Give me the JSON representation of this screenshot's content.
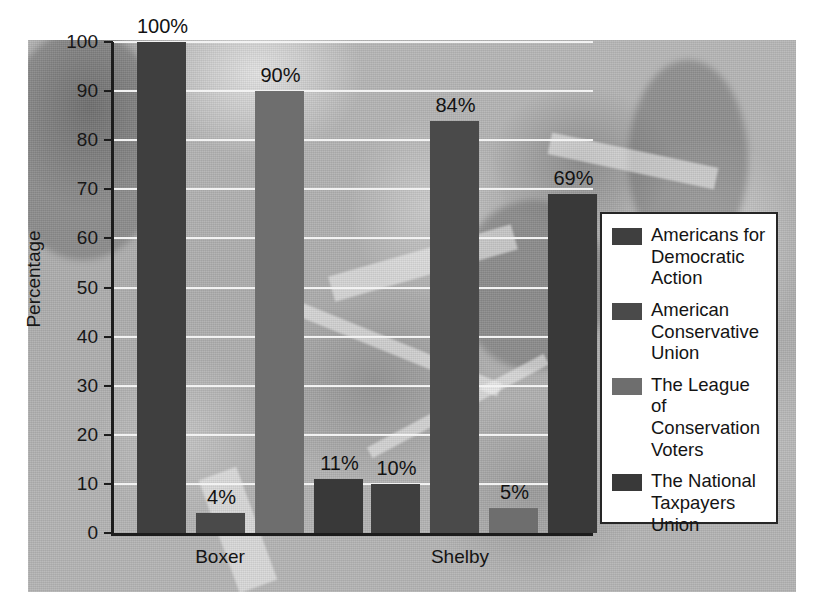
{
  "chart_data": {
    "type": "bar",
    "title": "",
    "xlabel": "",
    "ylabel": "Percentage",
    "ylim": [
      0,
      100
    ],
    "ytick_labels": [
      "100",
      "90",
      "80",
      "70",
      "60",
      "50",
      "40",
      "30",
      "20",
      "10",
      "0"
    ],
    "ytick_values": [
      100,
      90,
      80,
      70,
      60,
      50,
      40,
      30,
      20,
      10,
      0
    ],
    "grid": true,
    "legend_position": "right",
    "categories": [
      "Boxer",
      "Shelby"
    ],
    "series": [
      {
        "name": "Americans for Democratic Action",
        "color": "#3f3f3f",
        "values": [
          100,
          10
        ],
        "value_labels": [
          "100%",
          "10%"
        ]
      },
      {
        "name": "American Conservative Union",
        "color": "#4a4a4a",
        "values": [
          4,
          84
        ],
        "value_labels": [
          "4%",
          "84%"
        ]
      },
      {
        "name": "The League of Conservation Voters",
        "color": "#6e6e6e",
        "values": [
          90,
          5
        ],
        "value_labels": [
          "90%",
          "5%"
        ]
      },
      {
        "name": "The National Taxpayers Union",
        "color": "#393939",
        "values": [
          11,
          69
        ],
        "value_labels": [
          "11%",
          "69%"
        ]
      }
    ],
    "bars_in_draw_order": [
      {
        "group": "Boxer",
        "series": "Americans for Democratic Action",
        "value": 100,
        "label": "100%"
      },
      {
        "group": "Boxer",
        "series": "American Conservative Union",
        "value": 4,
        "label": "4%"
      },
      {
        "group": "Boxer",
        "series": "The League of Conservation Voters",
        "value": 90,
        "label": "90%"
      },
      {
        "group": "Boxer",
        "series": "The National Taxpayers Union",
        "value": 11,
        "label": "11%"
      },
      {
        "group": "Shelby",
        "series": "Americans for Democratic Action",
        "value": 10,
        "label": "10%"
      },
      {
        "group": "Shelby",
        "series": "American Conservative Union",
        "value": 84,
        "label": "84%"
      },
      {
        "group": "Shelby",
        "series": "The League of Conservation Voters",
        "value": 5,
        "label": "5%"
      },
      {
        "group": "Shelby",
        "series": "The National Taxpayers Union",
        "value": 69,
        "label": "69%"
      }
    ]
  },
  "axis": {
    "y_label": "Percentage",
    "ticks": [
      {
        "label": "100"
      },
      {
        "label": "90"
      },
      {
        "label": "80"
      },
      {
        "label": "70"
      },
      {
        "label": "60"
      },
      {
        "label": "50"
      },
      {
        "label": "40"
      },
      {
        "label": "30"
      },
      {
        "label": "20"
      },
      {
        "label": "10"
      },
      {
        "label": "0"
      }
    ]
  },
  "categories": [
    {
      "label": "Boxer"
    },
    {
      "label": "Shelby"
    }
  ],
  "bar_labels": [
    {
      "text": "100%"
    },
    {
      "text": "4%"
    },
    {
      "text": "90%"
    },
    {
      "text": "11%"
    },
    {
      "text": "10%"
    },
    {
      "text": "84%"
    },
    {
      "text": "5%"
    },
    {
      "text": "69%"
    }
  ],
  "legend": {
    "items": [
      {
        "label": "Americans for Democratic Action",
        "color": "#3f3f3f"
      },
      {
        "label": "American Conservative Union",
        "color": "#4a4a4a"
      },
      {
        "label": "The League of Conservation Voters",
        "color": "#6e6e6e"
      },
      {
        "label": "The National Taxpayers Union",
        "color": "#393939"
      }
    ]
  },
  "colors": {
    "plot_background": "#b2b2b2",
    "gridline": "#f2f2f2",
    "axis": "#1c1c1c",
    "legend_background": "#ffffff",
    "legend_border": "#262626",
    "text": "#141414"
  }
}
